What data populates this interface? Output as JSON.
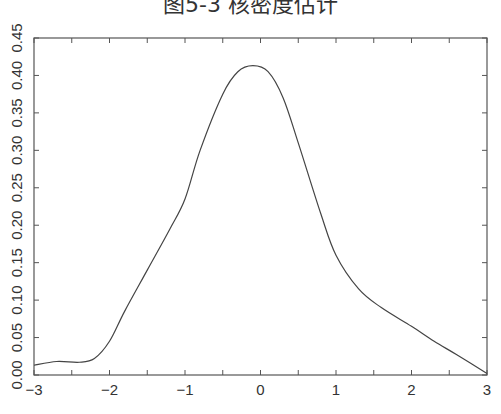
{
  "chart_data": {
    "type": "line",
    "title": "图5-3 核密度估计",
    "xlabel": "",
    "ylabel": "",
    "xlim": [
      -3,
      3
    ],
    "ylim": [
      0,
      0.45
    ],
    "grid": false,
    "legend": null,
    "x_ticks": [
      "−3",
      "−2",
      "−1",
      "0",
      "1",
      "2",
      "3"
    ],
    "x_tick_values": [
      -3,
      -2,
      -1,
      0,
      1,
      2,
      3
    ],
    "y_ticks": [
      "0.00",
      "0.05",
      "0.10",
      "0.15",
      "0.20",
      "0.25",
      "0.30",
      "0.35",
      "0.40",
      "0.45"
    ],
    "y_tick_values": [
      0,
      0.05,
      0.1,
      0.15,
      0.2,
      0.25,
      0.3,
      0.35,
      0.4,
      0.45
    ],
    "series": [
      {
        "name": "density",
        "color": "#444444",
        "x": [
          -3.0,
          -2.7,
          -2.4,
          -2.2,
          -2.0,
          -1.8,
          -1.5,
          -1.2,
          -1.0,
          -0.8,
          -0.5,
          -0.3,
          -0.1,
          0.1,
          0.3,
          0.5,
          0.8,
          1.0,
          1.3,
          1.6,
          2.0,
          2.3,
          2.6,
          3.0
        ],
        "y": [
          0.013,
          0.018,
          0.017,
          0.022,
          0.045,
          0.085,
          0.14,
          0.195,
          0.235,
          0.3,
          0.375,
          0.405,
          0.413,
          0.405,
          0.37,
          0.31,
          0.215,
          0.16,
          0.115,
          0.09,
          0.065,
          0.045,
          0.027,
          0.002
        ]
      }
    ]
  }
}
